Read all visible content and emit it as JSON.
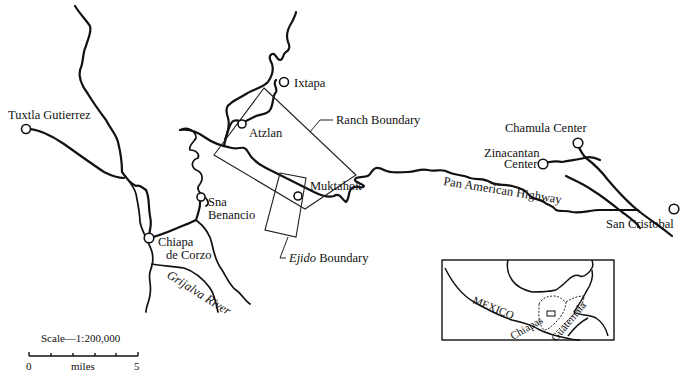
{
  "map": {
    "towns": [
      {
        "name": "Tuxtla Gutierrez"
      },
      {
        "name": "Ixtapa"
      },
      {
        "name": "Atzlan"
      },
      {
        "name": "Muktahok"
      },
      {
        "name": "Sna Benancio",
        "lines": [
          "Sna",
          "Benancio"
        ]
      },
      {
        "name": "Chiapa de Corzo",
        "lines": [
          "Chiapa",
          "de Corzo"
        ]
      },
      {
        "name": "Chamula Center"
      },
      {
        "name": "Zinacantan Center",
        "lines": [
          "Zinacantan",
          "Center"
        ]
      },
      {
        "name": "San Cristobal"
      }
    ],
    "labels": {
      "ranch_boundary": "Ranch Boundary",
      "ejido_italic": "Ejido",
      "ejido_rest": " Boundary",
      "highway": "Pan American Highway",
      "river": "Grijalva River"
    },
    "inset": {
      "country": "MEXICO",
      "state": "Chiapas",
      "neighbor": "Guatemala"
    },
    "scale": {
      "title": "Scale—1:200,000",
      "start": "0",
      "unit": "miles",
      "end": "5"
    }
  }
}
